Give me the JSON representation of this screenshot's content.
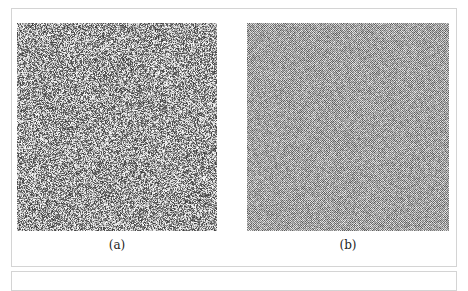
{
  "figure": {
    "panels": [
      {
        "id": "a",
        "caption": "(a)",
        "description": "white noise pattern",
        "tone": "#9a9a9a"
      },
      {
        "id": "b",
        "caption": "(b)",
        "description": "blue noise pattern",
        "tone": "#a8a8a8"
      }
    ]
  }
}
